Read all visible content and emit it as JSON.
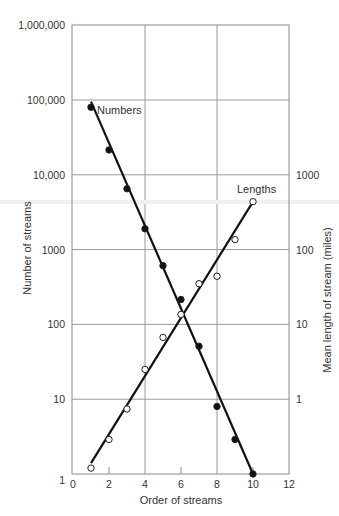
{
  "chart_data": {
    "type": "scatter",
    "title": "",
    "xlabel": "Order of streams",
    "ylabel": "Number of streams",
    "ylabel_right": "Mean length of stream (miles)",
    "xlim": [
      0,
      12
    ],
    "ylim": [
      1,
      1000000
    ],
    "ylim_right": [
      0.1,
      100000
    ],
    "yscale": "log",
    "grid": true,
    "x_ticks": [
      "0",
      "2",
      "4",
      "6",
      "8",
      "10",
      "12"
    ],
    "y_ticks_left": [
      "1",
      "10",
      "100",
      "1000",
      "10,000",
      "100,000",
      "1,000,000"
    ],
    "y_ticks_right": [
      "1",
      "10",
      "100",
      "1000"
    ],
    "series": [
      {
        "name": "Numbers",
        "axis": "left",
        "marker": "filled-circle",
        "x": [
          1,
          2,
          3,
          4,
          5,
          6,
          7,
          8,
          9,
          10
        ],
        "values": [
          80000,
          21500,
          6500,
          1900,
          610,
          215,
          51,
          8,
          2.9,
          1
        ],
        "fit_line": {
          "x": [
            1,
            10
          ],
          "y": [
            95000,
            1
          ]
        }
      },
      {
        "name": "Lengths",
        "axis": "right",
        "marker": "open-circle",
        "x": [
          1,
          2,
          3,
          4,
          5,
          6,
          7,
          8,
          9,
          10
        ],
        "values": [
          0.12,
          0.29,
          0.74,
          2.5,
          6.7,
          13.6,
          35,
          44,
          136,
          437
        ],
        "fit_line": {
          "x": [
            1,
            10
          ],
          "y": [
            0.14,
            437
          ]
        }
      }
    ],
    "annotations": [
      "Numbers",
      "Lengths"
    ]
  }
}
